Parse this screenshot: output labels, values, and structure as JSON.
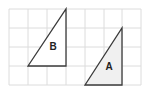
{
  "diagram": {
    "type": "grid-with-triangles",
    "colors": {
      "background": "#ffffff",
      "grid": "#dcdcdc",
      "outline": "#3a3a3a",
      "fill_a": "#f0f0f0",
      "fill_b": "#ffffff"
    },
    "grid": {
      "x_lines": [
        9,
        28,
        47,
        66,
        85,
        104,
        122,
        141
      ],
      "y_lines": [
        9,
        28,
        47,
        66,
        85
      ]
    },
    "shapes": [
      {
        "id": "B",
        "label": "B",
        "points": [
          [
            28,
            66
          ],
          [
            66,
            9
          ],
          [
            66,
            66
          ]
        ],
        "label_pos": [
          53,
          50
        ]
      },
      {
        "id": "A",
        "label": "A",
        "points": [
          [
            85,
            85
          ],
          [
            122,
            28
          ],
          [
            122,
            85
          ]
        ],
        "label_pos": [
          109,
          70
        ]
      }
    ]
  }
}
